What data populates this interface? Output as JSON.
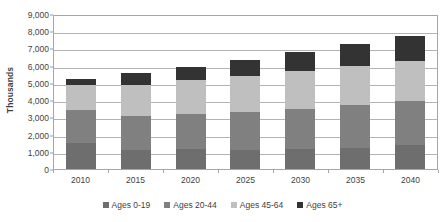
{
  "chart_data": {
    "type": "bar",
    "subtype": "stacked-bar",
    "title": "",
    "xlabel": "",
    "ylabel": "Thousands",
    "ylim": [
      0,
      9000
    ],
    "ytick_step": 1000,
    "ytick_labels": [
      "9,000",
      "8,000",
      "7,000",
      "6,000",
      "5,000",
      "4,000",
      "3,000",
      "2,000",
      "1,000",
      "0"
    ],
    "ytick_values": [
      9000,
      8000,
      7000,
      6000,
      5000,
      4000,
      3000,
      2000,
      1000,
      0
    ],
    "grid": true,
    "grid_axis": "y",
    "legend_position": "bottom",
    "categories": [
      "2010",
      "2015",
      "2020",
      "2025",
      "2030",
      "2035",
      "2040"
    ],
    "series": [
      {
        "name": "Ages 0-19",
        "color": "#6e6e6e",
        "values": [
          1500,
          1120,
          1170,
          1090,
          1150,
          1240,
          1380
        ]
      },
      {
        "name": "Ages 20-44",
        "color": "#808080",
        "values": [
          1930,
          1980,
          2000,
          2210,
          2350,
          2460,
          2550
        ]
      },
      {
        "name": "Ages 45-64",
        "color": "#bfbfbf",
        "values": [
          1470,
          1780,
          2010,
          2110,
          2220,
          2300,
          2340
        ]
      },
      {
        "name": "Ages 65+",
        "color": "#333333",
        "values": [
          330,
          690,
          750,
          950,
          1100,
          1260,
          1480
        ]
      }
    ],
    "totals": [
      5230,
      5570,
      5930,
      6360,
      6820,
      7260,
      7750
    ]
  },
  "legend": {
    "items": [
      {
        "label": "Ages 0-19",
        "swatch": "legend-swatch-ages-0-19"
      },
      {
        "label": "Ages 20-44",
        "swatch": "legend-swatch-ages-20-44"
      },
      {
        "label": "Ages 45-64",
        "swatch": "legend-swatch-ages-45-64"
      },
      {
        "label": "Ages 65+",
        "swatch": "legend-swatch-ages-65-plus"
      }
    ]
  },
  "colors": {
    "plot_border": "#a6a6a6",
    "gridline": "#b3b3b3",
    "text": "#3f3f3f",
    "background": "#ffffff"
  }
}
